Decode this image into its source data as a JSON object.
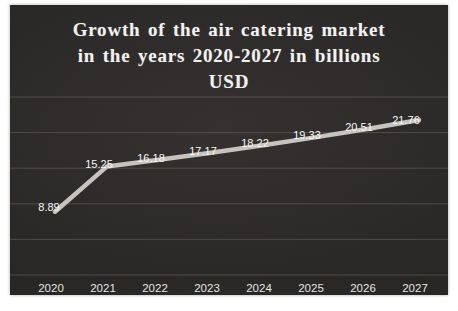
{
  "page": {
    "background_color": "#ffffff"
  },
  "chart_data": {
    "type": "line",
    "title": "Growth of the air catering market in the years 2020-2027 in billions USD",
    "title_lines": [
      "Growth of the air catering market",
      "in the years 2020-2027 in billions",
      "USD"
    ],
    "categories": [
      "2020",
      "2021",
      "2022",
      "2023",
      "2024",
      "2025",
      "2026",
      "2027"
    ],
    "values": [
      8.89,
      15.25,
      16.18,
      17.17,
      18.22,
      19.33,
      20.51,
      21.76
    ],
    "value_labels": [
      "8.89",
      "15.25",
      "16.18",
      "17.17",
      "18.22",
      "19.33",
      "20.51",
      "21.76"
    ],
    "xlabel": "",
    "ylabel": "",
    "ylim": [
      0,
      25
    ],
    "grid_step": 5,
    "grid": "horizontal",
    "legend": "none",
    "colors": {
      "background": "#2b2928",
      "title_text": "#f2f1ef",
      "line": "#c7c4c0",
      "data_label_text": "#f7f6f3",
      "axis_label_text": "#e6e4e1",
      "gridline": "rgba(186,175,152,0.25)"
    }
  }
}
